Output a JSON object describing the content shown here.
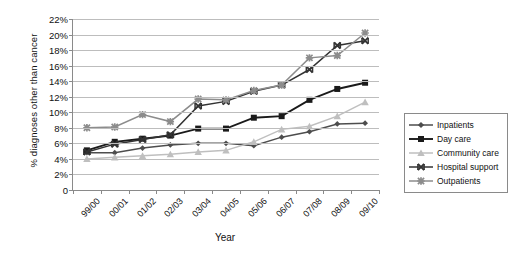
{
  "chart_data": {
    "type": "line",
    "title": "",
    "xlabel": "Year",
    "ylabel": "% diagnoses other than cancer",
    "categories": [
      "99/00",
      "00/01",
      "01/02",
      "02/03",
      "03/04",
      "04/05",
      "05/06",
      "06/07",
      "07/08",
      "08/09",
      "09/10"
    ],
    "ylim": [
      0,
      22
    ],
    "ytick_values": [
      0,
      2,
      4,
      6,
      8,
      10,
      12,
      14,
      16,
      18,
      20,
      22
    ],
    "ytick_labels": [
      "0",
      "2%",
      "4%",
      "6%",
      "8%",
      "10%",
      "12%",
      "14%",
      "16%",
      "18%",
      "20%",
      "22%"
    ],
    "grid": true,
    "legend_position": "right",
    "series": [
      {
        "name": "Inpatients",
        "marker": "diamond",
        "color": "#4d4d4d",
        "values": [
          4.8,
          4.8,
          5.4,
          5.8,
          6.0,
          6.0,
          5.7,
          6.8,
          7.5,
          8.5,
          8.6
        ]
      },
      {
        "name": "Day care",
        "marker": "square",
        "color": "#1a1a1a",
        "values": [
          5.1,
          6.2,
          6.6,
          7.0,
          7.9,
          7.9,
          9.3,
          9.5,
          11.6,
          13.0,
          13.8
        ]
      },
      {
        "name": "Community care",
        "marker": "triangle",
        "color": "#bfbfbf",
        "values": [
          4.0,
          4.2,
          4.4,
          4.6,
          4.9,
          5.1,
          6.2,
          7.8,
          8.2,
          9.5,
          11.3
        ]
      },
      {
        "name": "Hospital support",
        "marker": "x",
        "color": "#333333",
        "values": [
          4.9,
          5.9,
          6.5,
          7.1,
          10.8,
          11.4,
          12.7,
          13.5,
          15.5,
          18.6,
          19.2
        ]
      },
      {
        "name": "Outpatients",
        "marker": "star",
        "color": "#8c8c8c",
        "values": [
          8.0,
          8.1,
          9.7,
          8.8,
          11.7,
          11.6,
          12.8,
          13.5,
          17.0,
          17.3,
          20.2
        ]
      }
    ]
  }
}
